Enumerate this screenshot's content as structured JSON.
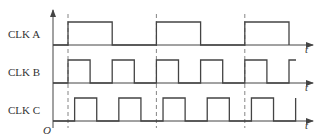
{
  "diagram": {
    "type": "timing-diagram",
    "origin_label": "O",
    "time_axis_label": "t",
    "signals": [
      {
        "name": "CLK A",
        "period_units": 4,
        "phase_units": 0,
        "edges": [
          0,
          2,
          4,
          6,
          8,
          10
        ],
        "levels": [
          0,
          1,
          0,
          1,
          0,
          1,
          0
        ]
      },
      {
        "name": "CLK B",
        "period_units": 2,
        "phase_units": 0,
        "edges": [
          0,
          1,
          2,
          3,
          4,
          5,
          6,
          7,
          8,
          9,
          10
        ],
        "levels": [
          0,
          1,
          0,
          1,
          0,
          1,
          0,
          1,
          0,
          1,
          0,
          1
        ]
      },
      {
        "name": "CLK C",
        "period_units": 2,
        "phase_units": 0.3,
        "edges": [
          0.3,
          1.3,
          2.3,
          3.3,
          4.3,
          5.3,
          6.3,
          7.3,
          8.3,
          9.3,
          10.3
        ],
        "levels": [
          0,
          1,
          0,
          1,
          0,
          1,
          0,
          1,
          0,
          1,
          0,
          1
        ]
      }
    ],
    "reference_lines_units": [
      0,
      4,
      8
    ],
    "visible_time_range_units": [
      -0.7,
      10.3
    ]
  }
}
